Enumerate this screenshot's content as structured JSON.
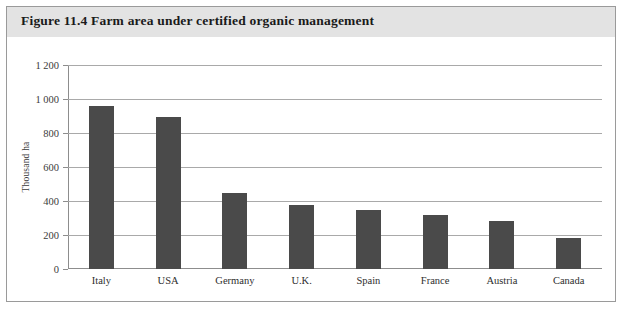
{
  "figure": {
    "title": "Figure 11.4  Farm area under certified organic management",
    "border_color": "#9a9a9a",
    "title_band_color": "#e3e3e3"
  },
  "chart_data": {
    "type": "bar",
    "title": "Figure 11.4  Farm area under certified organic management",
    "xlabel": "",
    "ylabel": "Thousand ha",
    "categories": [
      "Italy",
      "USA",
      "Germany",
      "U.K.",
      "Spain",
      "France",
      "Austria",
      "Canada"
    ],
    "values": [
      960,
      895,
      445,
      375,
      350,
      315,
      285,
      185
    ],
    "ylim": [
      0,
      1200
    ],
    "ytick_labels": [
      "0",
      "200",
      "400",
      "600",
      "800",
      "1 000",
      "1 200"
    ],
    "ytick_values": [
      0,
      200,
      400,
      600,
      800,
      1000,
      1200
    ],
    "grid": true,
    "legend": "none",
    "bar_color": "#4a4a4a",
    "gridline_color": "#a9a9a9",
    "axis_color": "#8d8d8d"
  }
}
